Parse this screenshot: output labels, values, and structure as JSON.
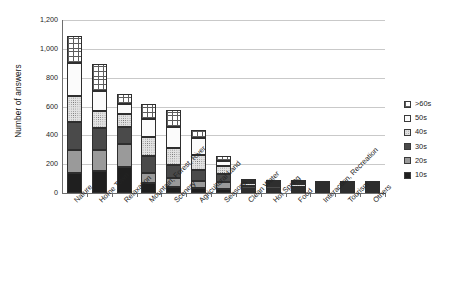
{
  "chart_data": {
    "type": "bar",
    "subtype": "stacked-bar",
    "title": "",
    "xlabel": "",
    "ylabel": "Number of answers",
    "ylim": [
      0,
      1200
    ],
    "yticks": [
      0,
      200,
      400,
      600,
      800,
      1000,
      1200
    ],
    "ytick_labels": [
      "0",
      "200",
      "400",
      "600",
      "800",
      "1,000",
      "1,200"
    ],
    "grid": true,
    "legend_position": "right",
    "categories": [
      "Nature",
      "Home Town",
      "Relaxation",
      "Mountain, Forest, River",
      "Scenery",
      "Agricultural Land",
      "Seasons",
      "Clean Water",
      "Hot Spring",
      "Food",
      "Interaction, Recreation",
      "Tourism",
      "Others"
    ],
    "series": [
      {
        "name": "10s",
        "values": [
          140,
          150,
          180,
          70,
          45,
          35,
          30,
          12,
          10,
          10,
          10,
          5,
          5
        ]
      },
      {
        "name": "20s",
        "values": [
          160,
          150,
          160,
          70,
          60,
          50,
          45,
          15,
          12,
          12,
          12,
          6,
          5
        ]
      },
      {
        "name": "30s",
        "values": [
          190,
          150,
          120,
          115,
          90,
          75,
          55,
          20,
          18,
          16,
          15,
          7,
          6
        ]
      },
      {
        "name": "40s",
        "values": [
          180,
          120,
          90,
          135,
          115,
          105,
          60,
          22,
          20,
          18,
          16,
          8,
          6
        ]
      },
      {
        "name": "50s",
        "values": [
          235,
          140,
          70,
          125,
          145,
          115,
          35,
          14,
          13,
          12,
          10,
          5,
          4
        ]
      },
      {
        "name": ">60s",
        "values": [
          185,
          185,
          65,
          105,
          120,
          55,
          35,
          12,
          12,
          12,
          12,
          4,
          4
        ]
      }
    ],
    "totals": [
      1090,
      895,
      685,
      620,
      575,
      435,
      260,
      95,
      85,
      80,
      75,
      35,
      30
    ]
  },
  "legend": {
    "items": [
      {
        "label": ">60s",
        "swatch": "crosshatch-white"
      },
      {
        "label": "50s",
        "swatch": "white"
      },
      {
        "label": "40s",
        "swatch": "dotted-light-gray"
      },
      {
        "label": "30s",
        "swatch": "dark-gray"
      },
      {
        "label": "20s",
        "swatch": "medium-gray"
      },
      {
        "label": "10s",
        "swatch": "black"
      }
    ]
  }
}
